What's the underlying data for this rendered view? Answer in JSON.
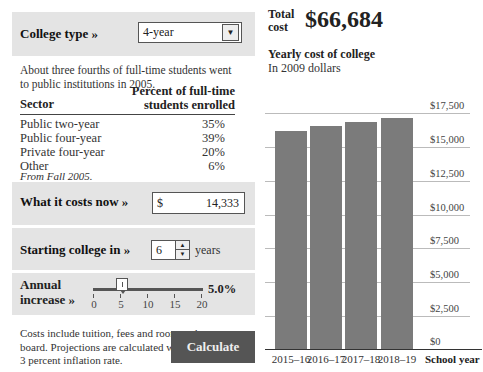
{
  "college_type": {
    "label": "College type »",
    "selected": "4-year"
  },
  "intro": "About three fourths of full-time students went to public institutions in 2005.",
  "table": {
    "headers": [
      "Sector",
      "Percent of full-time students enrolled"
    ],
    "rows": [
      {
        "sector": "Public two-year",
        "pct": "35%"
      },
      {
        "sector": "Public four-year",
        "pct": "39%"
      },
      {
        "sector": "Private four-year",
        "pct": "20%"
      },
      {
        "sector": "Other",
        "pct": "6%"
      }
    ],
    "source": "From Fall 2005."
  },
  "cost_now": {
    "label": "What it costs now »",
    "currency": "$",
    "value": "14,333"
  },
  "starting": {
    "label": "Starting college in »",
    "value": "6",
    "unit": "years"
  },
  "increase": {
    "label_line1": "Annual",
    "label_line2": "increase »",
    "value": "5.0%",
    "slider_min": 0,
    "slider_max": 20,
    "slider_pos": 5,
    "ticks": [
      "0",
      "5",
      "10",
      "15",
      "20"
    ]
  },
  "note": "Costs include tuition, fees and room and board. Projections are calculated with a 3 percent inflation rate.",
  "calculate_label": "Calculate",
  "total": {
    "label_line1": "Total",
    "label_line2": "cost",
    "value": "$66,684"
  },
  "chart_title": "Yearly cost of college",
  "chart_subtitle": "In 2009 dollars",
  "colors": {
    "panel": "#e4e4e4",
    "bar": "#7b7b7b",
    "button": "#555555"
  },
  "chart_data": {
    "type": "bar",
    "title": "Yearly cost of college",
    "subtitle": "In 2009 dollars",
    "categories": [
      "2015–16",
      "2016–17",
      "2017–18",
      "2018–19"
    ],
    "values": [
      16192,
      16509,
      16832,
      17151
    ],
    "xlabel": "School year",
    "ylabel": "",
    "ylim": [
      0,
      17500
    ],
    "yticks": [
      "$0",
      "$2,500",
      "$5,000",
      "$7,500",
      "$10,000",
      "$12,500",
      "$15,000",
      "$17,500"
    ],
    "grid": true,
    "y_axis_position": "right"
  }
}
